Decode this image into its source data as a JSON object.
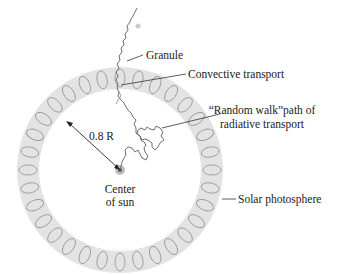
{
  "diagram": {
    "labels": {
      "granule": "Granule",
      "convective": "Convective transport",
      "random_walk_line1": "“Random walk”path of",
      "random_walk_line2": "radiative transport",
      "radius": "0.8 R",
      "center_line1": "Center",
      "center_line2": "of sun",
      "photosphere": "Solar photosphere"
    },
    "colors": {
      "shell": "#e3e3e3",
      "cell_stroke": "#9a9a9a",
      "path": "#6e6e6e",
      "leader": "#333333",
      "core": "#8a8a8a"
    }
  }
}
